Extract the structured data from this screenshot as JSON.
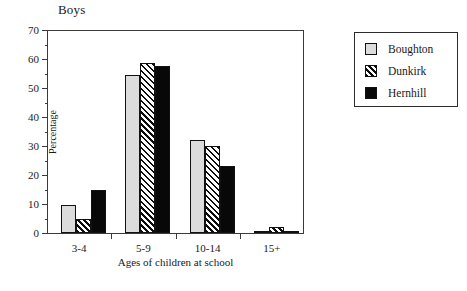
{
  "chart_data": {
    "type": "bar",
    "title": "Boys",
    "xlabel": "Ages of children at school",
    "ylabel": "Percentage",
    "categories": [
      "3-4",
      "5-9",
      "10-14",
      "15+"
    ],
    "series": [
      {
        "name": "Boughton",
        "values": [
          9.5,
          54.5,
          32.0,
          0.8
        ],
        "swatch": "light-gray"
      },
      {
        "name": "Dunkirk",
        "values": [
          5.0,
          58.5,
          30.0,
          2.0
        ],
        "swatch": "diagonal-hatch"
      },
      {
        "name": "Hernhill",
        "values": [
          15.0,
          57.5,
          23.0,
          0.7
        ],
        "swatch": "solid-black"
      }
    ],
    "ylim": [
      0,
      70
    ],
    "ytick_labels": [
      "0",
      "10",
      "20",
      "30",
      "40",
      "50",
      "60",
      "70"
    ],
    "ytick_values": [
      0,
      10,
      20,
      30,
      40,
      50,
      60,
      70
    ],
    "yminor_values": [
      5,
      15,
      25,
      35,
      45,
      55,
      65
    ],
    "grid": false,
    "legend_position": "right-outside",
    "colors": {
      "series_0": "#dcdcdc",
      "series_1": "#ffffff",
      "series_2": "#080808",
      "axis": "#3a3a3a",
      "outline": "#111111",
      "background": "#ffffff"
    }
  }
}
